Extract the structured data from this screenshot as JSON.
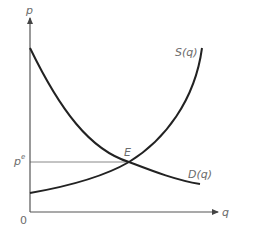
{
  "diagram": {
    "axes": {
      "y_label": "p",
      "x_label": "q",
      "origin_label": "0"
    },
    "curves": [
      {
        "name": "supply",
        "label": "S(q)",
        "shape": "increasing convex"
      },
      {
        "name": "demand",
        "label": "D(q)",
        "shape": "decreasing convex"
      }
    ],
    "equilibrium": {
      "point_label": "E",
      "price_label": "p",
      "price_superscript": "e"
    },
    "colors": {
      "curve": "#222222",
      "axis": "#555555",
      "guide_line": "#888888",
      "text": "#6b6b6b"
    }
  }
}
